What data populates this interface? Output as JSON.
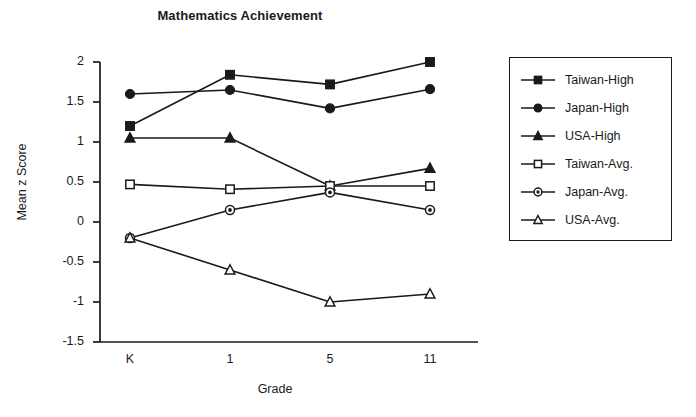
{
  "chart_data": {
    "type": "line",
    "title": "Mathematics Achievement",
    "xlabel": "Grade",
    "ylabel": "Mean z Score",
    "categories": [
      "K",
      "1",
      "5",
      "11"
    ],
    "ylim": [
      -1.5,
      2
    ],
    "yticks": [
      "2",
      "1.5",
      "1",
      "0.5",
      "0",
      "-0.5",
      "-1",
      "-1.5"
    ],
    "ytick_values": [
      2,
      1.5,
      1,
      0.5,
      0,
      -0.5,
      -1,
      -1.5
    ],
    "grid": false,
    "legend_position": "right-outside",
    "series": [
      {
        "name": "Taiwan-High",
        "marker": "filled-square",
        "values": [
          1.2,
          1.84,
          1.72,
          2.0
        ]
      },
      {
        "name": "Japan-High",
        "marker": "filled-circle",
        "values": [
          1.6,
          1.65,
          1.42,
          1.66
        ]
      },
      {
        "name": "USA-High",
        "marker": "filled-triangle",
        "values": [
          1.05,
          1.05,
          0.45,
          0.67
        ]
      },
      {
        "name": "Taiwan-Avg.",
        "marker": "open-square",
        "values": [
          0.47,
          0.41,
          0.45,
          0.45
        ]
      },
      {
        "name": "Japan-Avg.",
        "marker": "half-circle",
        "values": [
          -0.2,
          0.15,
          0.37,
          0.15
        ]
      },
      {
        "name": "USA-Avg.",
        "marker": "open-triangle",
        "values": [
          -0.2,
          -0.6,
          -1.0,
          -0.9
        ]
      }
    ]
  },
  "colors": {
    "ink": "#1a1a1a",
    "background": "#ffffff"
  }
}
